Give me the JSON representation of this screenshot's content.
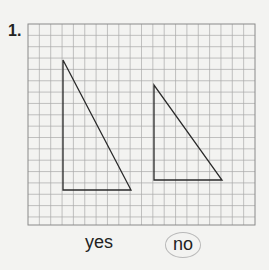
{
  "problem": {
    "number": "1.",
    "grid": {
      "x": 28,
      "y": 24,
      "width": 227,
      "height": 201,
      "cols": 20,
      "rows": 18,
      "line_color": "#a9a9a9",
      "border_color": "#8a8a8a"
    },
    "shapes": [
      {
        "name": "left-triangle",
        "points": "63,60 63,190 131,190"
      },
      {
        "name": "right-triangle",
        "points": "154,85 154,180 222,180"
      }
    ],
    "answers": [
      {
        "label": "yes",
        "circled": false
      },
      {
        "label": "no",
        "circled": true
      }
    ]
  }
}
